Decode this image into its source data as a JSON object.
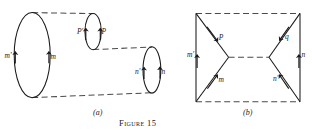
{
  "figure": {
    "caption": "Figure 15",
    "panels": [
      {
        "id": "a",
        "label": "(a)"
      },
      {
        "id": "b",
        "label": "(b)"
      }
    ],
    "panel_a": {
      "description": "Three ellipses connected by dashed generator lines forming a tube; each ellipse carries a pair of upward vectors.",
      "vectors": [
        {
          "name": "m-prime",
          "label": "m'"
        },
        {
          "name": "m",
          "label": "m"
        },
        {
          "name": "P-prime",
          "label": "P'"
        },
        {
          "name": "P",
          "label": "P"
        },
        {
          "name": "n-prime",
          "label": "n'"
        },
        {
          "name": "n",
          "label": "n"
        }
      ]
    },
    "panel_b": {
      "description": "Rectangular circuit with solid vertical sides, dashed top, middle and bottom lines, and solid diagonals meeting at interior nodes.",
      "vectors": [
        {
          "name": "m-prime",
          "label": "m'"
        },
        {
          "name": "P",
          "label": "P"
        },
        {
          "name": "q",
          "label": "q"
        },
        {
          "name": "n",
          "label": "n"
        },
        {
          "name": "m",
          "label": "m"
        },
        {
          "name": "n-prime",
          "label": "n'"
        }
      ]
    },
    "colors": {
      "ink": "#1a1a1a",
      "dash": "#555555",
      "background": "#ffffff"
    }
  }
}
